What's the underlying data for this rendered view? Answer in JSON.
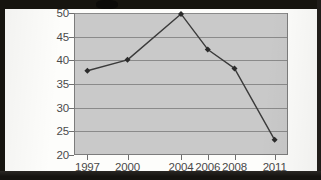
{
  "page": {
    "background_color": "#fdfdfb",
    "scan_band_color": "#16140f"
  },
  "chart_data": {
    "type": "line",
    "title": "",
    "subtitle": "",
    "xlabel": "",
    "ylabel": "",
    "categories": [
      "1997",
      "2000",
      "2004",
      "2006",
      "2008",
      "2011"
    ],
    "x": [
      1997,
      2000,
      2004,
      2006,
      2008,
      2011
    ],
    "values": [
      37.8,
      40.1,
      49.8,
      42.3,
      38.3,
      23.2
    ],
    "series": [
      {
        "name": "",
        "values": [
          37.8,
          40.1,
          49.8,
          42.3,
          38.3,
          23.2
        ]
      }
    ],
    "ylim": [
      20,
      50
    ],
    "xlim": [
      1996,
      2012
    ],
    "yticks": [
      20,
      25,
      30,
      35,
      40,
      45,
      50
    ],
    "ytick_labels": [
      "20",
      "25",
      "30",
      "35",
      "40",
      "45",
      "50"
    ],
    "xticks": [
      1997,
      2000,
      2004,
      2006,
      2008,
      2011
    ],
    "xtick_labels": [
      "1997",
      "2000",
      "2004",
      "2006",
      "2008",
      "2011"
    ],
    "grid": true,
    "grid_axis": "y",
    "legend": false,
    "legend_position": "none",
    "annotations": [],
    "marker": "diamond",
    "line_color": "#3b3b3b",
    "marker_color": "#2b2b2b",
    "plot_background_color": "#c9c9c9",
    "gridline_color": "#8a8a8a",
    "axis_color": "#7c7c7c",
    "tick_label_color": "#4a4a4a"
  }
}
